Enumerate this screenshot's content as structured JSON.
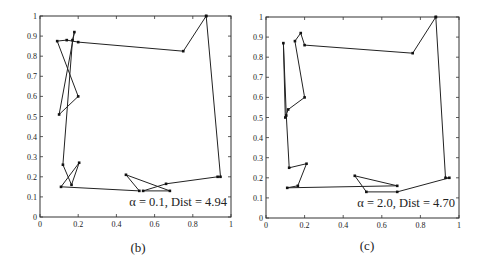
{
  "chart_data": [
    {
      "type": "line",
      "panel": "b",
      "caption": "(b)",
      "annotation": "α = 0.1, Dist = 4.94",
      "alpha": 0.1,
      "dist": 4.94,
      "xlim": [
        0,
        1
      ],
      "ylim": [
        0,
        1
      ],
      "xticks": [
        "0",
        "0.2",
        "0.4",
        "0.6",
        "0.8",
        "1"
      ],
      "xtick_values": [
        0,
        0.2,
        0.4,
        0.6,
        0.8,
        1
      ],
      "yticks": [
        "0",
        "0.1",
        "0.2",
        "0.3",
        "0.4",
        "0.5",
        "0.6",
        "0.7",
        "0.8",
        "0.9",
        "1"
      ],
      "ytick_values": [
        0,
        0.1,
        0.2,
        0.3,
        0.4,
        0.5,
        0.6,
        0.7,
        0.8,
        0.9,
        1
      ],
      "annotation_position": "bottom-right",
      "tour": [
        [
          0.87,
          1.0
        ],
        [
          0.75,
          0.825
        ],
        [
          0.2,
          0.87
        ],
        [
          0.14,
          0.88
        ],
        [
          0.09,
          0.875
        ],
        [
          0.2,
          0.6
        ],
        [
          0.1,
          0.51
        ],
        [
          0.18,
          0.92
        ],
        [
          0.17,
          0.88
        ],
        [
          0.12,
          0.26
        ],
        [
          0.165,
          0.16
        ],
        [
          0.205,
          0.27
        ],
        [
          0.11,
          0.15
        ],
        [
          0.52,
          0.13
        ],
        [
          0.45,
          0.21
        ],
        [
          0.68,
          0.13
        ],
        [
          0.54,
          0.13
        ],
        [
          0.66,
          0.165
        ],
        [
          0.93,
          0.2
        ],
        [
          0.945,
          0.2
        ],
        [
          0.87,
          1.0
        ]
      ]
    },
    {
      "type": "line",
      "panel": "c",
      "caption": "(c)",
      "annotation": "α = 2.0, Dist = 4.70",
      "alpha": 2.0,
      "dist": 4.7,
      "xlim": [
        0,
        1
      ],
      "ylim": [
        0,
        1
      ],
      "xticks": [
        "0",
        "0.2",
        "0.4",
        "0.6",
        "0.8",
        "1"
      ],
      "xtick_values": [
        0,
        0.2,
        0.4,
        0.6,
        0.8,
        1
      ],
      "yticks": [
        "0",
        "0.1",
        "0.2",
        "0.3",
        "0.4",
        "0.5",
        "0.6",
        "0.7",
        "0.8",
        "0.9",
        "1"
      ],
      "ytick_values": [
        0,
        0.1,
        0.2,
        0.3,
        0.4,
        0.5,
        0.6,
        0.7,
        0.8,
        0.9,
        1
      ],
      "annotation_position": "bottom-right",
      "tour": [
        [
          0.88,
          1.0
        ],
        [
          0.76,
          0.82
        ],
        [
          0.2,
          0.86
        ],
        [
          0.18,
          0.92
        ],
        [
          0.15,
          0.88
        ],
        [
          0.2,
          0.6
        ],
        [
          0.115,
          0.54
        ],
        [
          0.1,
          0.5
        ],
        [
          0.09,
          0.87
        ],
        [
          0.105,
          0.51
        ],
        [
          0.12,
          0.25
        ],
        [
          0.21,
          0.27
        ],
        [
          0.165,
          0.16
        ],
        [
          0.11,
          0.15
        ],
        [
          0.68,
          0.16
        ],
        [
          0.46,
          0.21
        ],
        [
          0.52,
          0.13
        ],
        [
          0.68,
          0.13
        ],
        [
          0.95,
          0.2
        ],
        [
          0.93,
          0.2
        ],
        [
          0.88,
          1.0
        ]
      ]
    }
  ]
}
